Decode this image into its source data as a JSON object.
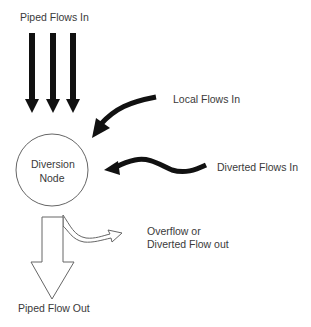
{
  "diagram": {
    "type": "flow-diagram",
    "node": {
      "line1": "Diversion",
      "line2": "Node"
    },
    "labels": {
      "piped_in": "Piped Flows In",
      "local_in": "Local Flows In",
      "diverted_in": "Diverted Flows In",
      "overflow_line1": "Overflow or",
      "overflow_line2": "Diverted Flow out",
      "piped_out": "Piped Flow Out"
    },
    "colors": {
      "solid_arrow": "#111111",
      "outline": "#666666",
      "text": "#3a3a3a"
    }
  }
}
